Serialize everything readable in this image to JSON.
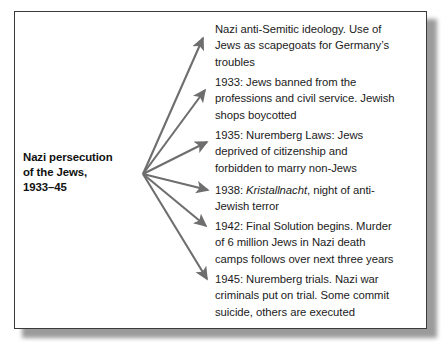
{
  "diagram": {
    "type": "spider-mind-map",
    "root": {
      "lines": [
        "Nazi persecution",
        "of the Jews,",
        "1933–45"
      ],
      "bold": true
    },
    "arrow_color": "#6e6e6e",
    "frame_border_color": "#3a3a3a",
    "text_color": "#1b1b1b",
    "background_color": "#ffffff",
    "branch_count": 6,
    "branches": [
      {
        "name": "ideology",
        "year": "",
        "lines": [
          {
            "text": "Nazi anti-Semitic ideology. Use of"
          },
          {
            "text": "Jews as scapegoats for Germany’s"
          },
          {
            "text": "troubles"
          }
        ]
      },
      {
        "name": "1933-bans",
        "year": "1933",
        "lines": [
          {
            "text": "1933: Jews banned from the"
          },
          {
            "text": "professions and civil service. Jewish"
          },
          {
            "text": "shops boycotted"
          }
        ]
      },
      {
        "name": "1935-nuremberg-laws",
        "year": "1935",
        "lines": [
          {
            "text": "1935: Nuremberg Laws: Jews"
          },
          {
            "text": "deprived of citizenship and"
          },
          {
            "text": "forbidden to marry non-Jews"
          }
        ]
      },
      {
        "name": "1938-kristallnacht",
        "year": "1938",
        "lines": [
          {
            "pre": "1938: ",
            "italic": "Kristallnacht",
            "post": ", night of anti-"
          },
          {
            "text": "Jewish terror"
          }
        ]
      },
      {
        "name": "1942-final-solution",
        "year": "1942",
        "lines": [
          {
            "text": "1942: Final Solution begins. Murder"
          },
          {
            "text": "of 6 million Jews in Nazi death"
          },
          {
            "text": "camps follows over next three years"
          }
        ]
      },
      {
        "name": "1945-nuremberg-trials",
        "year": "1945",
        "lines": [
          {
            "text": "1945: Nuremberg trials. Nazi war"
          },
          {
            "text": "criminals put on trial. Some commit"
          },
          {
            "text": "suicide, others are executed"
          }
        ]
      }
    ]
  }
}
